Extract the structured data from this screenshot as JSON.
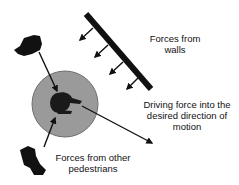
{
  "diagram": {
    "labels": {
      "walls": [
        "Forces from",
        "walls"
      ],
      "driving": [
        "Driving force into the",
        "desired direction of",
        "motion"
      ],
      "pedestrians": [
        "Forces from other",
        "pedestrians"
      ]
    },
    "colors": {
      "circle_fill": "#9a9a9a",
      "circle_stroke": "#6e6e6e",
      "ink": "#111111",
      "background": "#ffffff"
    },
    "elements": {
      "wall": "wall-bar",
      "focal_pedestrian": "pedestrian-top-view",
      "other_pedestrians": 2,
      "wall_force_arrows": 4
    }
  }
}
